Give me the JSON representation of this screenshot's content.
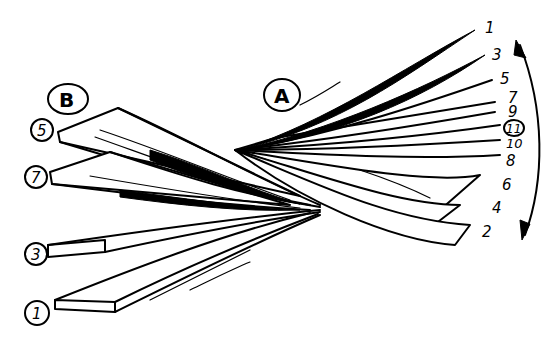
{
  "figure": {
    "group_b": {
      "label": "B",
      "layers": [
        "5",
        "7",
        "3",
        "1"
      ]
    },
    "group_a": {
      "label": "A",
      "layers": [
        "1",
        "3",
        "5",
        "7",
        "9",
        "11",
        "10",
        "8",
        "6",
        "4",
        "2"
      ],
      "circled_layer": "11"
    },
    "arrow": "curved-double-arrow"
  }
}
